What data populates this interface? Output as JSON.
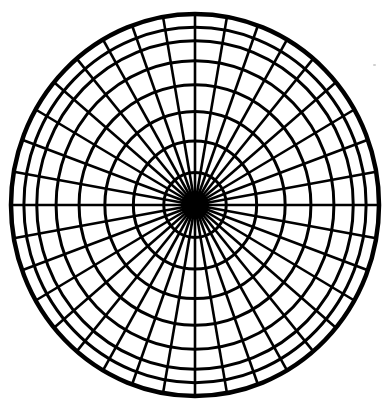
{
  "diagram": {
    "type": "polar-grid",
    "center": {
      "x": 195,
      "y": 205
    },
    "outer_radius": {
      "rx": 184,
      "ry": 191
    },
    "ring_fractions": [
      1.0,
      0.93,
      0.86,
      0.755,
      0.63,
      0.49,
      0.335,
      0.17
    ],
    "spoke_count": 36,
    "spoke_angle_step_deg": 10,
    "core_radius": 14,
    "colors": {
      "line": "#000000",
      "background": "#ffffff"
    },
    "outer_stroke_width": 4.5,
    "ring_stroke_width": 3,
    "spoke_stroke_width": 2.6
  }
}
